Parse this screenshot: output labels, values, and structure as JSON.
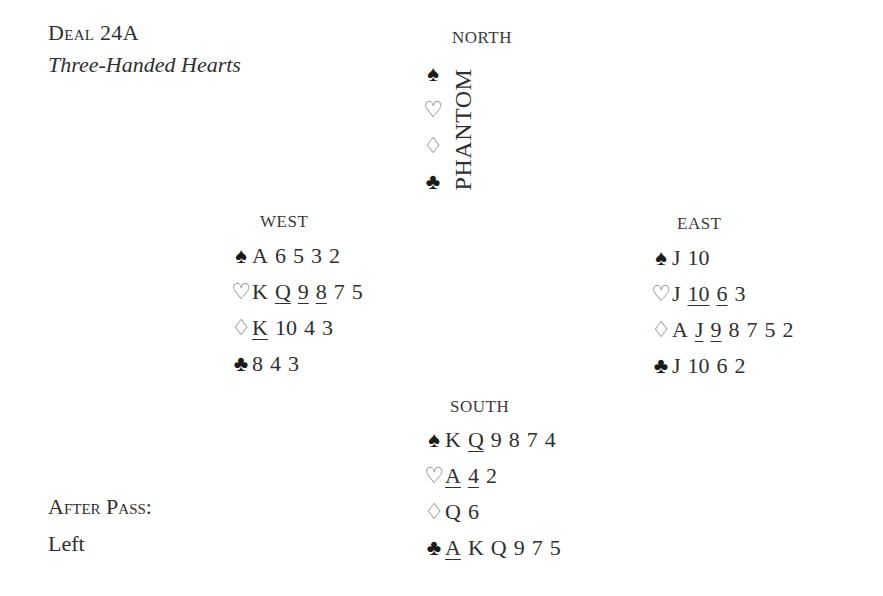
{
  "header": {
    "title": "Deal 24A",
    "subtitle": "Three-Handed Hearts"
  },
  "footer": {
    "after_pass_label": "After Pass:",
    "after_pass_value": "Left"
  },
  "suit_icons": {
    "spades": "♠",
    "hearts": "♡",
    "diamonds": "♢",
    "clubs": "♣"
  },
  "north": {
    "label": "NORTH",
    "name": "PHANTOM"
  },
  "west": {
    "label": "WEST",
    "spades": [
      {
        "c": "A",
        "u": false
      },
      {
        "c": "6",
        "u": false
      },
      {
        "c": "5",
        "u": false
      },
      {
        "c": "3",
        "u": false
      },
      {
        "c": "2",
        "u": false
      }
    ],
    "hearts": [
      {
        "c": "K",
        "u": false
      },
      {
        "c": "Q",
        "u": true
      },
      {
        "c": "9",
        "u": true
      },
      {
        "c": "8",
        "u": true
      },
      {
        "c": "7",
        "u": false
      },
      {
        "c": "5",
        "u": false
      }
    ],
    "diamonds": [
      {
        "c": "K",
        "u": true
      },
      {
        "c": "10",
        "u": false
      },
      {
        "c": "4",
        "u": false
      },
      {
        "c": "3",
        "u": false
      }
    ],
    "clubs": [
      {
        "c": "8",
        "u": false
      },
      {
        "c": "4",
        "u": false
      },
      {
        "c": "3",
        "u": false
      }
    ]
  },
  "east": {
    "label": "EAST",
    "spades": [
      {
        "c": "J",
        "u": false
      },
      {
        "c": "10",
        "u": false
      }
    ],
    "hearts": [
      {
        "c": "J",
        "u": false
      },
      {
        "c": "10",
        "u": true
      },
      {
        "c": "6",
        "u": true
      },
      {
        "c": "3",
        "u": false
      }
    ],
    "diamonds": [
      {
        "c": "A",
        "u": false
      },
      {
        "c": "J",
        "u": true
      },
      {
        "c": "9",
        "u": true
      },
      {
        "c": "8",
        "u": false
      },
      {
        "c": "7",
        "u": false
      },
      {
        "c": "5",
        "u": false
      },
      {
        "c": "2",
        "u": false
      }
    ],
    "clubs": [
      {
        "c": "J",
        "u": false
      },
      {
        "c": "10",
        "u": false
      },
      {
        "c": "6",
        "u": false
      },
      {
        "c": "2",
        "u": false
      }
    ]
  },
  "south": {
    "label": "SOUTH",
    "spades": [
      {
        "c": "K",
        "u": false
      },
      {
        "c": "Q",
        "u": true
      },
      {
        "c": "9",
        "u": false
      },
      {
        "c": "8",
        "u": false
      },
      {
        "c": "7",
        "u": false
      },
      {
        "c": "4",
        "u": false
      }
    ],
    "hearts": [
      {
        "c": "A",
        "u": true
      },
      {
        "c": "4",
        "u": true
      },
      {
        "c": "2",
        "u": false
      }
    ],
    "diamonds": [
      {
        "c": "Q",
        "u": false
      },
      {
        "c": "6",
        "u": false
      }
    ],
    "clubs": [
      {
        "c": "A",
        "u": true
      },
      {
        "c": "K",
        "u": false
      },
      {
        "c": "Q",
        "u": false
      },
      {
        "c": "9",
        "u": false
      },
      {
        "c": "7",
        "u": false
      },
      {
        "c": "5",
        "u": false
      }
    ]
  }
}
